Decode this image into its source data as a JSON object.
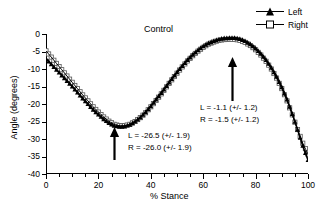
{
  "chart_data": {
    "type": "line",
    "title": "Control",
    "xlabel": "% Stance",
    "ylabel": "Angle (degrees)",
    "xlim": [
      0,
      100
    ],
    "ylim": [
      -40,
      0
    ],
    "xticks": [
      0,
      20,
      40,
      60,
      80,
      100
    ],
    "xtick_labels": [
      "0",
      "20",
      "40",
      "60",
      "80",
      "100"
    ],
    "yticks": [
      0,
      -5,
      -10,
      -15,
      -20,
      -25,
      -30,
      -35,
      -40
    ],
    "ytick_labels": [
      "0",
      "-5",
      "-10",
      "-15",
      "-20",
      "-25",
      "-30",
      "-35",
      "-40"
    ],
    "x_minor_tick_interval": 5,
    "grid": false,
    "legend_position": "top-right",
    "series": [
      {
        "name": "Left",
        "marker": "filled-triangle",
        "color": "#000000",
        "x": [
          0,
          2,
          4,
          6,
          8,
          10,
          12,
          14,
          16,
          18,
          20,
          22,
          24,
          26,
          28,
          30,
          32,
          34,
          36,
          38,
          40,
          42,
          44,
          46,
          48,
          50,
          52,
          54,
          56,
          58,
          60,
          62,
          64,
          66,
          68,
          70,
          72,
          74,
          76,
          78,
          80,
          82,
          84,
          86,
          88,
          90,
          92,
          94,
          96,
          98,
          100
        ],
        "y": [
          -7.0,
          -8.6,
          -10.2,
          -11.8,
          -13.4,
          -15.0,
          -16.7,
          -18.4,
          -20.0,
          -21.6,
          -23.0,
          -24.3,
          -25.4,
          -26.2,
          -26.5,
          -26.4,
          -25.9,
          -25.0,
          -23.8,
          -22.3,
          -20.6,
          -18.7,
          -16.8,
          -14.8,
          -12.8,
          -10.9,
          -9.1,
          -7.4,
          -5.9,
          -4.6,
          -3.5,
          -2.6,
          -2.0,
          -1.5,
          -1.2,
          -1.1,
          -1.1,
          -1.4,
          -2.0,
          -2.9,
          -4.1,
          -5.6,
          -7.4,
          -9.6,
          -12.2,
          -15.2,
          -18.7,
          -22.8,
          -27.3,
          -31.9,
          -36.0
        ]
      },
      {
        "name": "Right",
        "marker": "open-square",
        "color": "#000000",
        "x": [
          0,
          2,
          4,
          6,
          8,
          10,
          12,
          14,
          16,
          18,
          20,
          22,
          24,
          26,
          28,
          30,
          32,
          34,
          36,
          38,
          40,
          42,
          44,
          46,
          48,
          50,
          52,
          54,
          56,
          58,
          60,
          62,
          64,
          66,
          68,
          70,
          72,
          74,
          76,
          78,
          80,
          82,
          84,
          86,
          88,
          90,
          92,
          94,
          96,
          98,
          100
        ],
        "y": [
          -4.8,
          -6.6,
          -8.4,
          -10.2,
          -12.0,
          -13.8,
          -15.6,
          -17.4,
          -19.1,
          -20.8,
          -22.3,
          -23.7,
          -24.9,
          -25.8,
          -26.2,
          -26.2,
          -25.8,
          -25.0,
          -23.9,
          -22.5,
          -20.8,
          -19.0,
          -17.1,
          -15.1,
          -13.1,
          -11.2,
          -9.4,
          -7.7,
          -6.2,
          -4.9,
          -3.8,
          -2.9,
          -2.3,
          -1.8,
          -1.6,
          -1.5,
          -1.5,
          -1.8,
          -2.4,
          -3.3,
          -4.5,
          -6.0,
          -7.8,
          -10.0,
          -12.6,
          -15.6,
          -19.1,
          -23.1,
          -27.3,
          -31.2,
          -34.3
        ]
      }
    ],
    "annotations": [
      {
        "name": "peak-annotation",
        "lines": [
          "L = -1.1 (+/- 1.2)",
          "R = -1.5 (+/- 1.2)"
        ],
        "arrow_at_x": 71,
        "arrow_points": "up"
      },
      {
        "name": "trough-annotation",
        "lines": [
          "L = -26.5 (+/- 1.9)",
          "R = -26.0 (+/- 1.9)"
        ],
        "arrow_at_x": 26,
        "arrow_points": "up"
      }
    ]
  },
  "legend": {
    "items": [
      {
        "label": "Left",
        "marker": "filled-triangle"
      },
      {
        "label": "Right",
        "marker": "open-square"
      }
    ]
  }
}
